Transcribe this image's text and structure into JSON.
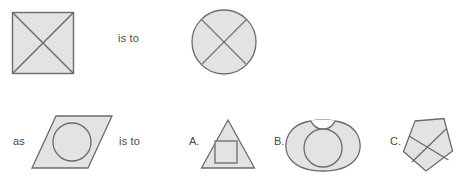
{
  "puzzle": {
    "type": "visual-analogy",
    "prompt_structure": "A is to B as C is to ?",
    "connectors": {
      "top_is_to": "is to",
      "as": "as",
      "bottom_is_to": "is to"
    },
    "option_labels": {
      "a": "A.",
      "b": "B.",
      "c": "C."
    }
  },
  "colors": {
    "background": "#ffffff",
    "shape_fill": "#e3e3e3",
    "shape_stroke": "#6b6b6b",
    "inner_stroke": "#6b6b6b",
    "text": "#4a4a4a"
  },
  "shapes": {
    "term_a": {
      "name": "square-with-x",
      "outline": "square",
      "inner": "x-diagonals",
      "x": 12,
      "y": 12,
      "width": 62,
      "height": 62
    },
    "term_b": {
      "name": "circle-with-x",
      "outline": "circle",
      "inner": "x-diagonals",
      "cx": 224,
      "cy": 42,
      "r": 32
    },
    "term_c": {
      "name": "parallelogram-with-circle",
      "outline": "parallelogram",
      "inner": "circle",
      "points": "56,116 112,116 88,168 32,168",
      "inner_cx": 72,
      "inner_cy": 142,
      "inner_r": 19
    },
    "option_a": {
      "name": "triangle-with-square",
      "outline": "triangle",
      "inner": "square",
      "points": "228,120 254,168 202,168",
      "inner_x": 215,
      "inner_y": 141,
      "inner_w": 22,
      "inner_h": 22
    },
    "option_b": {
      "name": "blob-with-circle",
      "outline": "notched-blob",
      "inner": "circle",
      "inner_cx": 323,
      "inner_cy": 147,
      "inner_r": 19
    },
    "option_c": {
      "name": "rotated-pentagon-with-x",
      "outline": "pentagon-rotated",
      "inner": "x-diagonals",
      "points": "415,122 443,118 452,152 427,171 404,152"
    }
  }
}
